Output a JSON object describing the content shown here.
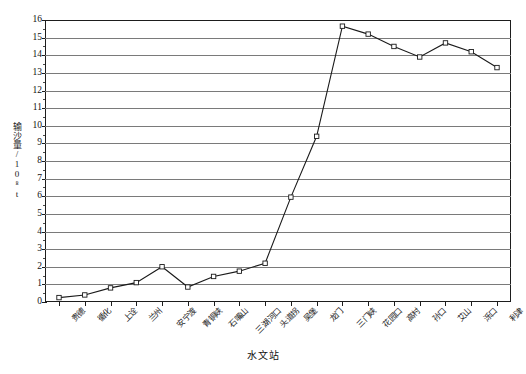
{
  "chart_data": {
    "type": "line",
    "title": "",
    "xlabel": "水文站",
    "ylabel": "输沙量/10⁸t",
    "ylim": [
      0,
      16
    ],
    "ytick_step": 1,
    "grid": true,
    "legend": "none",
    "marker": "open-square",
    "line_color": "#1a1a1a",
    "grid_color": "#7a7a7a",
    "categories": [
      "贵德",
      "循化",
      "上诠",
      "兰州",
      "安宁渡",
      "青铜峡",
      "石嘴山",
      "三湖河口",
      "头道拐",
      "吴堡",
      "龙门",
      "三门峡",
      "花园口",
      "高村",
      "孙口",
      "艾山",
      "泺口",
      "利津"
    ],
    "values": [
      0.25,
      0.4,
      0.8,
      1.1,
      2.0,
      0.85,
      1.45,
      1.75,
      2.2,
      5.95,
      9.4,
      15.65,
      15.2,
      14.5,
      13.9,
      14.7,
      14.2,
      13.3
    ],
    "ytick_labels": [
      "0",
      "1",
      "2",
      "3",
      "4",
      "5",
      "6",
      "7",
      "8",
      "9",
      "10",
      "11",
      "12",
      "13",
      "14",
      "15",
      "16"
    ]
  },
  "axis": {
    "y_title": "输沙量/10⁸t",
    "x_title": "水文站"
  },
  "caption": ""
}
